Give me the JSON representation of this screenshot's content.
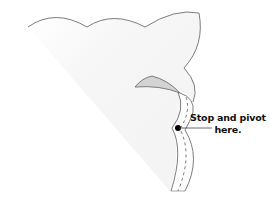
{
  "diagram": {
    "callout": {
      "line1": "Stop and pivot",
      "line2": "here."
    },
    "colors": {
      "outline": "#6e6e6e",
      "fabric_fill": "#f6f6f6",
      "flap_fill": "#d3d3d3",
      "dot": "#000000",
      "text": "#111111"
    }
  }
}
